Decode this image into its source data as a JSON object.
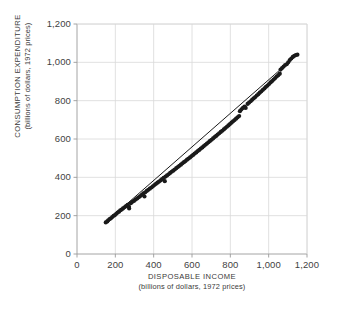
{
  "chart_data": {
    "type": "scatter",
    "title": "",
    "xlabel": "DISPOSABLE INCOME",
    "xlabel_sub": "(billions of dollars, 1972 prices)",
    "ylabel": "CONSUMPTION EXPENDITURE",
    "ylabel_sub": "(billions of dollars, 1972 prices)",
    "xlim": [
      0,
      1200
    ],
    "ylim": [
      0,
      1200
    ],
    "xticks": [
      0,
      200,
      400,
      600,
      800,
      1000,
      1200
    ],
    "yticks": [
      0,
      200,
      400,
      600,
      800,
      1000,
      1200
    ],
    "xtick_labels": [
      "0",
      "200",
      "400",
      "600",
      "800",
      "1,000",
      "1,200"
    ],
    "ytick_labels": [
      "0",
      "200",
      "400",
      "600",
      "800",
      "1,000",
      "1,200"
    ],
    "grid": true,
    "grid_color": "#d8d8d8",
    "axis_color": "#9a9a9a",
    "point_color": "#1a1a1a",
    "line_color": "#1a1a1a",
    "point_size": 2.1,
    "legend": null,
    "series": [
      {
        "name": "observations",
        "marker": "dot",
        "points": [
          [
            150,
            165
          ],
          [
            158,
            170
          ],
          [
            163,
            176
          ],
          [
            170,
            182
          ],
          [
            177,
            186
          ],
          [
            184,
            193
          ],
          [
            191,
            199
          ],
          [
            198,
            203
          ],
          [
            205,
            210
          ],
          [
            212,
            216
          ],
          [
            219,
            221
          ],
          [
            226,
            228
          ],
          [
            233,
            232
          ],
          [
            240,
            238
          ],
          [
            248,
            244
          ],
          [
            256,
            250
          ],
          [
            264,
            256
          ],
          [
            271,
            247
          ],
          [
            272,
            238
          ],
          [
            281,
            265
          ],
          [
            289,
            272
          ],
          [
            297,
            277
          ],
          [
            306,
            284
          ],
          [
            314,
            290
          ],
          [
            322,
            296
          ],
          [
            330,
            302
          ],
          [
            338,
            308
          ],
          [
            346,
            316
          ],
          [
            352,
            300
          ],
          [
            356,
            322
          ],
          [
            364,
            329
          ],
          [
            372,
            335
          ],
          [
            380,
            341
          ],
          [
            388,
            347
          ],
          [
            396,
            353
          ],
          [
            404,
            360
          ],
          [
            412,
            366
          ],
          [
            420,
            372
          ],
          [
            428,
            378
          ],
          [
            436,
            384
          ],
          [
            444,
            391
          ],
          [
            452,
            397
          ],
          [
            458,
            380
          ],
          [
            462,
            404
          ],
          [
            470,
            410
          ],
          [
            478,
            416
          ],
          [
            486,
            423
          ],
          [
            494,
            429
          ],
          [
            502,
            435
          ],
          [
            510,
            441
          ],
          [
            518,
            448
          ],
          [
            526,
            454
          ],
          [
            534,
            460
          ],
          [
            542,
            466
          ],
          [
            550,
            473
          ],
          [
            558,
            479
          ],
          [
            566,
            485
          ],
          [
            574,
            492
          ],
          [
            582,
            498
          ],
          [
            590,
            504
          ],
          [
            598,
            511
          ],
          [
            606,
            517
          ],
          [
            614,
            524
          ],
          [
            622,
            530
          ],
          [
            630,
            537
          ],
          [
            638,
            543
          ],
          [
            646,
            550
          ],
          [
            654,
            556
          ],
          [
            662,
            563
          ],
          [
            670,
            570
          ],
          [
            678,
            576
          ],
          [
            686,
            583
          ],
          [
            694,
            590
          ],
          [
            702,
            596
          ],
          [
            710,
            603
          ],
          [
            718,
            610
          ],
          [
            726,
            616
          ],
          [
            734,
            623
          ],
          [
            742,
            630
          ],
          [
            750,
            637
          ],
          [
            758,
            643
          ],
          [
            766,
            650
          ],
          [
            774,
            657
          ],
          [
            782,
            664
          ],
          [
            790,
            671
          ],
          [
            798,
            678
          ],
          [
            806,
            685
          ],
          [
            814,
            692
          ],
          [
            822,
            699
          ],
          [
            830,
            706
          ],
          [
            838,
            713
          ],
          [
            846,
            720
          ],
          [
            850,
            745
          ],
          [
            858,
            755
          ],
          [
            866,
            762
          ],
          [
            874,
            769
          ],
          [
            880,
            762
          ],
          [
            890,
            783
          ],
          [
            898,
            790
          ],
          [
            906,
            797
          ],
          [
            914,
            805
          ],
          [
            922,
            812
          ],
          [
            930,
            819
          ],
          [
            938,
            827
          ],
          [
            946,
            834
          ],
          [
            954,
            842
          ],
          [
            962,
            849
          ],
          [
            970,
            857
          ],
          [
            978,
            864
          ],
          [
            986,
            872
          ],
          [
            994,
            879
          ],
          [
            1002,
            887
          ],
          [
            1010,
            895
          ],
          [
            1018,
            902
          ],
          [
            1026,
            910
          ],
          [
            1034,
            918
          ],
          [
            1042,
            926
          ],
          [
            1050,
            933
          ],
          [
            1058,
            941
          ],
          [
            1062,
            962
          ],
          [
            1070,
            970
          ],
          [
            1078,
            978
          ],
          [
            1086,
            986
          ],
          [
            1094,
            990
          ],
          [
            1102,
            1000
          ],
          [
            1110,
            1012
          ],
          [
            1118,
            1020
          ],
          [
            1126,
            1028
          ],
          [
            1134,
            1034
          ],
          [
            1142,
            1038
          ],
          [
            1150,
            1040
          ]
        ]
      }
    ],
    "trendline": {
      "name": "fitted-line",
      "x_start": 148,
      "y_start": 163,
      "x_end": 1152,
      "y_end": 1042
    }
  }
}
